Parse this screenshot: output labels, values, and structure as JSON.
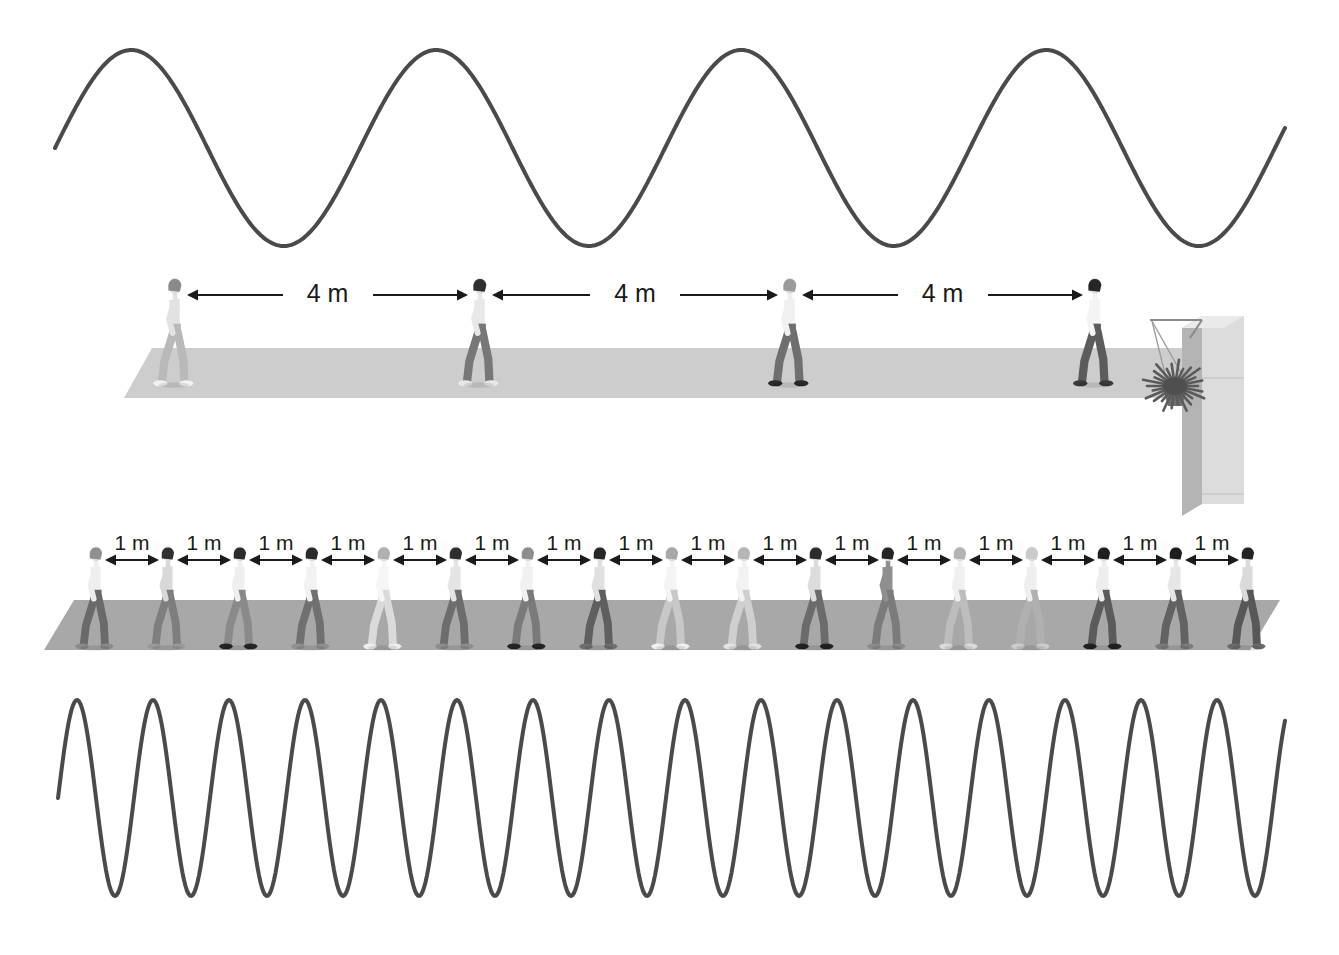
{
  "figure": {
    "title_visible": false,
    "background_color": "#ffffff",
    "wave_color": "#4a4a4a",
    "wave_stroke_width": 4,
    "label_color": "#1a1a1a",
    "ground_color_top": "#cdcdcd",
    "ground_color_bottom": "#a8a8a8",
    "building_color_front": "#dcdcdc",
    "building_color_side": "#b4b4b4",
    "plant_color": "#5a5a5a"
  },
  "top_panel": {
    "spacing_labels": [
      "4 m",
      "4 m",
      "4 m"
    ],
    "people_count": 4,
    "wave_cycles": 4,
    "wave_peaks": 4,
    "people": [
      {
        "label": "walker-1",
        "hair": "#8a8a8a",
        "shirt": "#e2e2e2",
        "legs": "#b9b9b9",
        "shoes": "#f2f2f2"
      },
      {
        "label": "walker-2",
        "hair": "#2f2f2f",
        "shirt": "#e8e8e8",
        "legs": "#777777",
        "shoes": "#e8e8e8"
      },
      {
        "label": "walker-3",
        "hair": "#9a9a9a",
        "shirt": "#f0f0f0",
        "legs": "#6f6f6f",
        "shoes": "#2a2a2a"
      },
      {
        "label": "walker-4",
        "hair": "#262626",
        "shirt": "#f4f4f4",
        "legs": "#5c5c5c",
        "shoes": "#3a3a3a"
      }
    ]
  },
  "bottom_panel": {
    "spacing_labels": [
      "1 m",
      "1 m",
      "1 m",
      "1 m",
      "1 m",
      "1 m",
      "1 m",
      "1 m",
      "1 m",
      "1 m",
      "1 m",
      "1 m",
      "1 m",
      "1 m",
      "1 m",
      "1 m"
    ],
    "people_count": 17,
    "wave_cycles": 16,
    "wave_peaks": 16,
    "people": [
      {
        "label": "walker-1",
        "hair": "#909090",
        "shirt": "#eeeeee",
        "legs": "#6a6a6a",
        "shoes": "#8a8a8a"
      },
      {
        "label": "walker-2",
        "hair": "#303030",
        "shirt": "#d8d8d8",
        "legs": "#7e7e7e",
        "shoes": "#9a9a9a"
      },
      {
        "label": "walker-3",
        "hair": "#2b2b2b",
        "shirt": "#efefef",
        "legs": "#8a8a8a",
        "shoes": "#252525"
      },
      {
        "label": "walker-4",
        "hair": "#2a2a2a",
        "shirt": "#f2f2f2",
        "legs": "#707070",
        "shoes": "#909090"
      },
      {
        "label": "walker-5",
        "hair": "#b0b0b0",
        "shirt": "#f6f6f6",
        "legs": "#dadada",
        "shoes": "#ededed"
      },
      {
        "label": "walker-6",
        "hair": "#2e2e2e",
        "shirt": "#e4e4e4",
        "legs": "#6d6d6d",
        "shoes": "#8d8d8d"
      },
      {
        "label": "walker-7",
        "hair": "#8d8d8d",
        "shirt": "#f1f1f1",
        "legs": "#7a7a7a",
        "shoes": "#242424"
      },
      {
        "label": "walker-8",
        "hair": "#262626",
        "shirt": "#e0e0e0",
        "legs": "#5f5f5f",
        "shoes": "#6f6f6f"
      },
      {
        "label": "walker-9",
        "hair": "#a8a8a8",
        "shirt": "#f4f4f4",
        "legs": "#c8c8c8",
        "shoes": "#efefef"
      },
      {
        "label": "walker-10",
        "hair": "#b6b6b6",
        "shirt": "#f2f2f2",
        "legs": "#cfcfcf",
        "shoes": "#e2e2e2"
      },
      {
        "label": "walker-11",
        "hair": "#2c2c2c",
        "shirt": "#dcdcdc",
        "legs": "#6b6b6b",
        "shoes": "#222222"
      },
      {
        "label": "walker-12",
        "hair": "#242424",
        "shirt": "#8f8f8f",
        "legs": "#7b7b7b",
        "shoes": "#8b8b8b"
      },
      {
        "label": "walker-13",
        "hair": "#b4b4b4",
        "shirt": "#f0f0f0",
        "legs": "#bdbdbd",
        "shoes": "#dcdcdc"
      },
      {
        "label": "walker-14",
        "hair": "#cacaca",
        "shirt": "#efefef",
        "legs": "#b0b0b0",
        "shoes": "#cccccc"
      },
      {
        "label": "walker-15",
        "hair": "#1f1f1f",
        "shirt": "#ededed",
        "legs": "#5b5b5b",
        "shoes": "#222222"
      },
      {
        "label": "walker-16",
        "hair": "#1d1d1d",
        "shirt": "#e6e6e6",
        "legs": "#626262",
        "shoes": "#7b7b7b"
      },
      {
        "label": "walker-17",
        "hair": "#232323",
        "shirt": "#dadada",
        "legs": "#585858",
        "shoes": "#6a6a6a"
      }
    ]
  },
  "building": {
    "has_hanging_plant": true,
    "plant_label": "hanging-flower-basket"
  },
  "chart_data": {
    "type": "line",
    "title": "",
    "xlabel": "",
    "ylabel": "",
    "grid": false,
    "legend_position": "none",
    "series": [
      {
        "name": "long-wavelength-wave",
        "wavelength_m": 4,
        "cycles": 4,
        "amplitude_px": 98,
        "period_px": 305,
        "x_start_px": 55,
        "x_end_px": 1285,
        "baseline_y_px": 148
      },
      {
        "name": "short-wavelength-wave",
        "wavelength_m": 1,
        "cycles": 16,
        "amplitude_px": 98,
        "period_px": 76,
        "x_start_px": 58,
        "x_end_px": 1285,
        "baseline_y_px": 798
      }
    ]
  }
}
